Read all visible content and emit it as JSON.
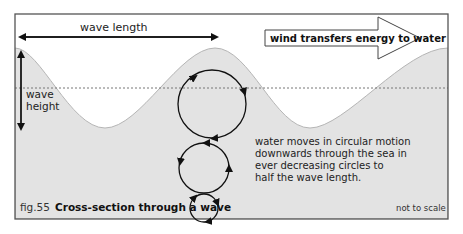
{
  "figure": {
    "number": "fig.55",
    "title": "Cross-section through a wave",
    "note": "not to scale"
  },
  "labels": {
    "wave_length": "wave length",
    "wave_height_line1": "wave",
    "wave_height_line2": "height",
    "wind_arrow": "wind transfers energy to water",
    "motion_line1": "water moves in circular motion",
    "motion_line2": "downwards through the sea in",
    "motion_line3": "ever decreasing circles to",
    "motion_line4": "half  the wave length."
  },
  "colors": {
    "water": "#e3e3e3",
    "frame": "#555555",
    "wave_outline": "#b5b5b5",
    "arrow": "#111111",
    "wind_arrow_fill": "#ffffff"
  },
  "circles": [
    {
      "cx": 212,
      "cy": 104,
      "r": 34
    },
    {
      "cx": 204,
      "cy": 168,
      "r": 25
    },
    {
      "cx": 204,
      "cy": 208,
      "r": 14
    }
  ]
}
